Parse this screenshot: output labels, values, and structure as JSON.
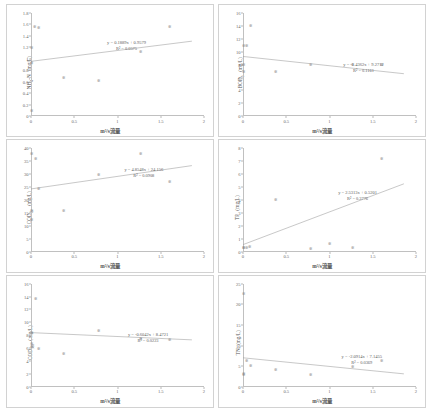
{
  "figure": {
    "xlabel": "m³/s流量",
    "panels": [
      {
        "id": "nh4n",
        "ylabel_main": "NH",
        "ylabel_sub": "4",
        "ylabel_rest": "-N（mg/L）",
        "equation": "y = 0.1889x + 0.9579",
        "r2": "R² = 0.0575",
        "yticks": [
          "0",
          "0.2",
          "0.4",
          "0.6",
          "0.8",
          "1",
          "1.2",
          "1.4",
          "1.6",
          "1.8"
        ],
        "xticks": [
          "0",
          "0.5",
          "1",
          "1.5",
          "2"
        ],
        "ylim": [
          0,
          1.8
        ],
        "xlim": [
          0,
          2
        ],
        "points": [
          {
            "x": 0.01,
            "y": 0.1
          },
          {
            "x": 0.01,
            "y": 0.93
          },
          {
            "x": 0.01,
            "y": 1.2
          },
          {
            "x": 0.04,
            "y": 1.57
          },
          {
            "x": 0.09,
            "y": 1.55
          },
          {
            "x": 0.38,
            "y": 0.67
          },
          {
            "x": 0.78,
            "y": 0.62
          },
          {
            "x": 1.27,
            "y": 1.13
          },
          {
            "x": 1.6,
            "y": 1.56
          }
        ],
        "trend": {
          "slope": 0.1889,
          "intercept": 0.9579
        },
        "eqn_pos": {
          "left_pct": 44,
          "top_pct": 26
        }
      },
      {
        "id": "bod5",
        "ylabel_main": "BOD",
        "ylabel_sub": "5",
        "ylabel_rest": "（mg/L）",
        "equation": "y = -1.4362x + 9.2712",
        "r2": "R² = 0.1161",
        "yticks": [
          "0",
          "2",
          "4",
          "6",
          "8",
          "10",
          "12",
          "14",
          "16"
        ],
        "xticks": [
          "0",
          "0.5",
          "1",
          "1.5",
          "2"
        ],
        "ylim": [
          0,
          16
        ],
        "xlim": [
          0,
          2
        ],
        "points": [
          {
            "x": 0.01,
            "y": 7.0
          },
          {
            "x": 0.01,
            "y": 8.0
          },
          {
            "x": 0.01,
            "y": 11.0
          },
          {
            "x": 0.04,
            "y": 11.0
          },
          {
            "x": 0.09,
            "y": 14.0
          },
          {
            "x": 0.38,
            "y": 7.0
          },
          {
            "x": 0.78,
            "y": 8.0
          },
          {
            "x": 1.27,
            "y": 8.0
          },
          {
            "x": 1.6,
            "y": 8.0
          }
        ],
        "trend": {
          "slope": -1.4362,
          "intercept": 9.2712
        },
        "eqn_pos": {
          "left_pct": 58,
          "top_pct": 47
        }
      },
      {
        "id": "cod",
        "ylabel_main": "COD",
        "ylabel_sub": "Cr",
        "ylabel_rest": "（mg/L）",
        "equation": "y = 4.8548x + 24.156",
        "r2": "R² = 0.0908",
        "yticks": [
          "0",
          "5",
          "10",
          "15",
          "20",
          "25",
          "30",
          "35",
          "40"
        ],
        "xticks": [
          "0",
          "0.5",
          "1",
          "1.5",
          "2"
        ],
        "ylim": [
          0,
          40
        ],
        "xlim": [
          0,
          2
        ],
        "points": [
          {
            "x": 0.01,
            "y": 12.5
          },
          {
            "x": 0.01,
            "y": 16.0
          },
          {
            "x": 0.01,
            "y": 38.0
          },
          {
            "x": 0.05,
            "y": 36.0
          },
          {
            "x": 0.09,
            "y": 24.5
          },
          {
            "x": 0.38,
            "y": 16.0
          },
          {
            "x": 0.78,
            "y": 30.0
          },
          {
            "x": 1.27,
            "y": 38.0
          },
          {
            "x": 1.6,
            "y": 27.0
          }
        ],
        "trend": {
          "slope": 4.8548,
          "intercept": 24.156
        },
        "eqn_pos": {
          "left_pct": 54,
          "top_pct": 18
        }
      },
      {
        "id": "tp",
        "ylabel_main": "TP",
        "ylabel_sub": "",
        "ylabel_rest": "（mg/L）",
        "equation": "y = 2.5313x + 0.5201",
        "r2": "R² = 0.3776",
        "yticks": [
          "0",
          "1",
          "2",
          "3",
          "4",
          "5",
          "6",
          "7",
          "8"
        ],
        "xticks": [
          "0",
          "0.5",
          "1",
          "1.5",
          "2"
        ],
        "ylim": [
          0,
          8
        ],
        "xlim": [
          0,
          2
        ],
        "points": [
          {
            "x": 0.01,
            "y": 0.3
          },
          {
            "x": 0.01,
            "y": 0.35
          },
          {
            "x": 0.04,
            "y": 0.3
          },
          {
            "x": 0.07,
            "y": 0.4
          },
          {
            "x": 0.38,
            "y": 4.0
          },
          {
            "x": 0.78,
            "y": 0.25
          },
          {
            "x": 1.0,
            "y": 0.6
          },
          {
            "x": 1.27,
            "y": 0.35
          },
          {
            "x": 1.6,
            "y": 7.2
          }
        ],
        "trend": {
          "slope": 2.5313,
          "intercept": 0.5201
        },
        "eqn_pos": {
          "left_pct": 55,
          "top_pct": 40
        }
      },
      {
        "id": "codmn",
        "ylabel_main": "COD",
        "ylabel_sub": "Mn",
        "ylabel_rest": "（mg/L）",
        "equation": "y = -0.6042x + 8.4721",
        "r2": "R² = 0.0223",
        "yticks": [
          "0",
          "2",
          "4",
          "6",
          "8",
          "10",
          "12",
          "14",
          "16"
        ],
        "xticks": [
          "0",
          "0.5",
          "1",
          "1.5",
          "2"
        ],
        "ylim": [
          0,
          16
        ],
        "xlim": [
          0,
          2
        ],
        "points": [
          {
            "x": 0.01,
            "y": 6.7
          },
          {
            "x": 0.01,
            "y": 6.3
          },
          {
            "x": 0.01,
            "y": 8.4
          },
          {
            "x": 0.05,
            "y": 13.7
          },
          {
            "x": 0.09,
            "y": 6.0
          },
          {
            "x": 0.38,
            "y": 5.2
          },
          {
            "x": 0.78,
            "y": 8.8
          },
          {
            "x": 1.27,
            "y": 7.5
          },
          {
            "x": 1.6,
            "y": 7.3
          }
        ],
        "trend": {
          "slope": -0.6042,
          "intercept": 8.4721
        },
        "eqn_pos": {
          "left_pct": 56,
          "top_pct": 47
        }
      },
      {
        "id": "tn",
        "ylabel_main": "TN",
        "ylabel_sub": "",
        "ylabel_rest": "（mg/L）",
        "equation": "y = -2.0914x + 7.1455",
        "r2": "R² = 0.0369",
        "yticks": [
          "0",
          "5",
          "10",
          "15",
          "20",
          "25"
        ],
        "xticks": [
          "0",
          "0.5",
          "1",
          "1.5",
          "2"
        ],
        "ylim": [
          0,
          25
        ],
        "xlim": [
          0,
          2
        ],
        "points": [
          {
            "x": 0.01,
            "y": 3.0
          },
          {
            "x": 0.01,
            "y": 3.2
          },
          {
            "x": 0.01,
            "y": 22.5
          },
          {
            "x": 0.04,
            "y": 6.3
          },
          {
            "x": 0.09,
            "y": 5.2
          },
          {
            "x": 0.38,
            "y": 4.2
          },
          {
            "x": 0.78,
            "y": 3.0
          },
          {
            "x": 1.27,
            "y": 5.0
          },
          {
            "x": 1.6,
            "y": 6.5
          }
        ],
        "trend": {
          "slope": -2.0914,
          "intercept": 7.1455
        },
        "eqn_pos": {
          "left_pct": 57,
          "top_pct": 68
        }
      }
    ]
  },
  "chart_data": [
    {
      "type": "scatter",
      "title": "NH4-N vs flow",
      "xlabel": "m³/s流量",
      "ylabel": "NH4-N（mg/L）",
      "xlim": [
        0,
        2
      ],
      "ylim": [
        0,
        1.8
      ],
      "grid": false,
      "legend": "none",
      "x": [
        0.01,
        0.01,
        0.01,
        0.04,
        0.09,
        0.38,
        0.78,
        1.27,
        1.6
      ],
      "y": [
        0.1,
        0.93,
        1.2,
        1.57,
        1.55,
        0.67,
        0.62,
        1.13,
        1.56
      ],
      "trendline": {
        "equation": "y = 0.1889x + 0.9579",
        "slope": 0.1889,
        "intercept": 0.9579,
        "r2": 0.0575,
        "r2_label": "R² = 0.0575"
      }
    },
    {
      "type": "scatter",
      "title": "BOD5 vs flow",
      "xlabel": "m³/s流量",
      "ylabel": "BOD5（mg/L）",
      "xlim": [
        0,
        2
      ],
      "ylim": [
        0,
        16
      ],
      "grid": false,
      "legend": "none",
      "x": [
        0.01,
        0.01,
        0.01,
        0.04,
        0.09,
        0.38,
        0.78,
        1.27,
        1.6
      ],
      "y": [
        7.0,
        8.0,
        11.0,
        11.0,
        14.0,
        7.0,
        8.0,
        8.0,
        8.0
      ],
      "trendline": {
        "equation": "y = -1.4362x + 9.2712",
        "slope": -1.4362,
        "intercept": 9.2712,
        "r2": 0.1161,
        "r2_label": "R² = 0.1161"
      }
    },
    {
      "type": "scatter",
      "title": "CODCr vs flow",
      "xlabel": "m³/s流量",
      "ylabel": "CODCr（mg/L）",
      "xlim": [
        0,
        2
      ],
      "ylim": [
        0,
        40
      ],
      "grid": false,
      "legend": "none",
      "x": [
        0.01,
        0.01,
        0.01,
        0.05,
        0.09,
        0.38,
        0.78,
        1.27,
        1.6
      ],
      "y": [
        12.5,
        16.0,
        38.0,
        36.0,
        24.5,
        16.0,
        30.0,
        38.0,
        27.0
      ],
      "trendline": {
        "equation": "y = 4.8548x + 24.156",
        "slope": 4.8548,
        "intercept": 24.156,
        "r2": 0.0908,
        "r2_label": "R² = 0.0908"
      }
    },
    {
      "type": "scatter",
      "title": "TP vs flow",
      "xlabel": "m³/s流量",
      "ylabel": "TP（mg/L）",
      "xlim": [
        0,
        2
      ],
      "ylim": [
        0,
        8
      ],
      "grid": false,
      "legend": "none",
      "x": [
        0.01,
        0.01,
        0.04,
        0.07,
        0.38,
        0.78,
        1.0,
        1.27,
        1.6
      ],
      "y": [
        0.3,
        0.35,
        0.3,
        0.4,
        4.0,
        0.25,
        0.6,
        0.35,
        7.2
      ],
      "trendline": {
        "equation": "y = 2.5313x + 0.5201",
        "slope": 2.5313,
        "intercept": 0.5201,
        "r2": 0.3776,
        "r2_label": "R² = 0.3776"
      }
    },
    {
      "type": "scatter",
      "title": "CODMn vs flow",
      "xlabel": "m³/s流量",
      "ylabel": "CODMn（mg/L）",
      "xlim": [
        0,
        2
      ],
      "ylim": [
        0,
        16
      ],
      "grid": false,
      "legend": "none",
      "x": [
        0.01,
        0.01,
        0.01,
        0.05,
        0.09,
        0.38,
        0.78,
        1.27,
        1.6
      ],
      "y": [
        6.7,
        6.3,
        8.4,
        13.7,
        6.0,
        5.2,
        8.8,
        7.5,
        7.3
      ],
      "trendline": {
        "equation": "y = -0.6042x + 8.4721",
        "slope": -0.6042,
        "intercept": 8.4721,
        "r2": 0.0223,
        "r2_label": "R² = 0.0223"
      }
    },
    {
      "type": "scatter",
      "title": "TN vs flow",
      "xlabel": "m³/s流量",
      "ylabel": "TN（mg/L）",
      "xlim": [
        0,
        2
      ],
      "ylim": [
        0,
        25
      ],
      "grid": false,
      "legend": "none",
      "x": [
        0.01,
        0.01,
        0.01,
        0.04,
        0.09,
        0.38,
        0.78,
        1.27,
        1.6
      ],
      "y": [
        3.0,
        3.2,
        22.5,
        6.3,
        5.2,
        4.2,
        3.0,
        5.0,
        6.5
      ],
      "trendline": {
        "equation": "y = -2.0914x + 7.1455",
        "slope": -2.0914,
        "intercept": 7.1455,
        "r2": 0.0369,
        "r2_label": "R² = 0.0369"
      }
    }
  ]
}
